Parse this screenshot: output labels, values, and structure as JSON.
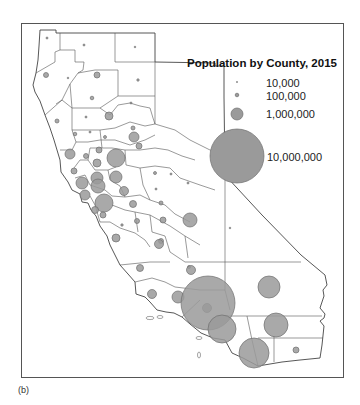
{
  "legend": {
    "title": "Population by County, 2015",
    "items": [
      {
        "label": "10,000",
        "radius": 0.6
      },
      {
        "label": "100,000",
        "radius": 1.8
      },
      {
        "label": "1,000,000",
        "radius": 6
      },
      {
        "label": "10,000,000",
        "radius": 27
      }
    ]
  },
  "caption": "(b)",
  "colors": {
    "symbol_fill": "#9a9a9a",
    "symbol_stroke": "#6e6e6e",
    "boundary": "#444444",
    "land": "#ffffff"
  },
  "map": {
    "region": "California",
    "symbol_type": "proportional circles",
    "symbols": [
      {
        "x": 47,
        "y": 38,
        "r": 1
      },
      {
        "x": 84,
        "y": 45,
        "r": 1
      },
      {
        "x": 135,
        "y": 47,
        "r": 0.8
      },
      {
        "x": 46,
        "y": 75,
        "r": 2.5
      },
      {
        "x": 68,
        "y": 78,
        "r": 0.8
      },
      {
        "x": 97,
        "y": 75,
        "r": 3
      },
      {
        "x": 138,
        "y": 80,
        "r": 1.2
      },
      {
        "x": 92,
        "y": 98,
        "r": 1.8
      },
      {
        "x": 131,
        "y": 103,
        "r": 1
      },
      {
        "x": 57,
        "y": 121,
        "r": 2
      },
      {
        "x": 86,
        "y": 117,
        "r": 1
      },
      {
        "x": 109,
        "y": 116,
        "r": 4
      },
      {
        "x": 75,
        "y": 134,
        "r": 1.8
      },
      {
        "x": 90,
        "y": 132,
        "r": 1
      },
      {
        "x": 105,
        "y": 137,
        "r": 1.5
      },
      {
        "x": 133,
        "y": 128,
        "r": 2
      },
      {
        "x": 134,
        "y": 137,
        "r": 5
      },
      {
        "x": 70,
        "y": 154,
        "r": 5
      },
      {
        "x": 86,
        "y": 156,
        "r": 2.5
      },
      {
        "x": 99,
        "y": 150,
        "r": 3
      },
      {
        "x": 116,
        "y": 158,
        "r": 9
      },
      {
        "x": 139,
        "y": 146,
        "r": 3
      },
      {
        "x": 74,
        "y": 171,
        "r": 3
      },
      {
        "x": 97,
        "y": 163,
        "r": 4
      },
      {
        "x": 97,
        "y": 178,
        "r": 6
      },
      {
        "x": 116,
        "y": 177,
        "r": 6
      },
      {
        "x": 155,
        "y": 173,
        "r": 1.5
      },
      {
        "x": 82,
        "y": 183,
        "r": 6
      },
      {
        "x": 98,
        "y": 186,
        "r": 7
      },
      {
        "x": 85,
        "y": 195,
        "r": 5
      },
      {
        "x": 124,
        "y": 191,
        "r": 4.5
      },
      {
        "x": 104,
        "y": 203,
        "r": 9
      },
      {
        "x": 95,
        "y": 210,
        "r": 3.5
      },
      {
        "x": 133,
        "y": 204,
        "r": 3.5
      },
      {
        "x": 161,
        "y": 203,
        "r": 2
      },
      {
        "x": 103,
        "y": 215,
        "r": 3
      },
      {
        "x": 137,
        "y": 221,
        "r": 2.5
      },
      {
        "x": 156,
        "y": 189,
        "r": 1
      },
      {
        "x": 171,
        "y": 174,
        "r": 1
      },
      {
        "x": 188,
        "y": 183,
        "r": 1
      },
      {
        "x": 122,
        "y": 225,
        "r": 1.2
      },
      {
        "x": 163,
        "y": 220,
        "r": 3
      },
      {
        "x": 161,
        "y": 241,
        "r": 2.5
      },
      {
        "x": 116,
        "y": 238,
        "r": 4
      },
      {
        "x": 190,
        "y": 220,
        "r": 7
      },
      {
        "x": 159,
        "y": 244,
        "r": 4.5
      },
      {
        "x": 189,
        "y": 267,
        "r": 1.5
      },
      {
        "x": 230,
        "y": 228,
        "r": 0.8
      },
      {
        "x": 140,
        "y": 268,
        "r": 3.5
      },
      {
        "x": 191,
        "y": 270,
        "r": 4.5
      },
      {
        "x": 207,
        "y": 308,
        "r": 4.5
      },
      {
        "x": 152,
        "y": 294,
        "r": 4.5
      },
      {
        "x": 178,
        "y": 297,
        "r": 6
      },
      {
        "x": 208,
        "y": 303,
        "r": 27
      },
      {
        "x": 269,
        "y": 287,
        "r": 11
      },
      {
        "x": 222,
        "y": 329,
        "r": 14
      },
      {
        "x": 276,
        "y": 325,
        "r": 12
      },
      {
        "x": 254,
        "y": 353,
        "r": 15
      },
      {
        "x": 296,
        "y": 350,
        "r": 3
      }
    ]
  }
}
